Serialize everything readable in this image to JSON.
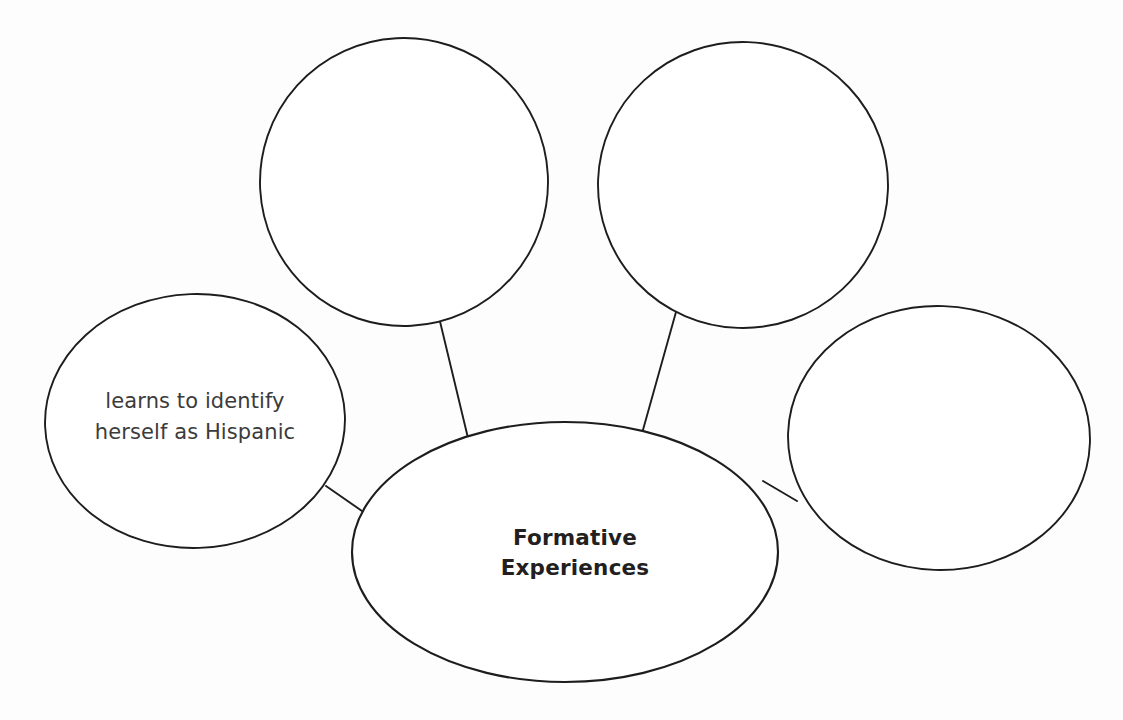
{
  "document": {
    "title": "Formative Experiences Concept Map",
    "background_color": "#ffffff",
    "ink_color": "#1d1d1d",
    "canvas": {
      "width": 1123,
      "height": 720
    }
  },
  "diagram": {
    "type": "concept-map-web",
    "center": {
      "id": "center",
      "shape": "ellipse",
      "label": "Formative\nExperiences",
      "text_color": "#231f20",
      "filled": true
    },
    "nodes": [
      {
        "id": "top-left",
        "shape": "ellipse",
        "label": "",
        "text_color": "#3c3b3b",
        "filled": false
      },
      {
        "id": "top-right",
        "shape": "ellipse",
        "label": "",
        "text_color": "#3c3b3b",
        "filled": false
      },
      {
        "id": "left",
        "shape": "ellipse",
        "label": "learns to identify\nherself as Hispanic",
        "text_color": "#3c3b3b",
        "filled": true
      },
      {
        "id": "right",
        "shape": "ellipse",
        "label": "",
        "text_color": "#3c3b3b",
        "filled": false
      }
    ],
    "connector_count": 4
  }
}
